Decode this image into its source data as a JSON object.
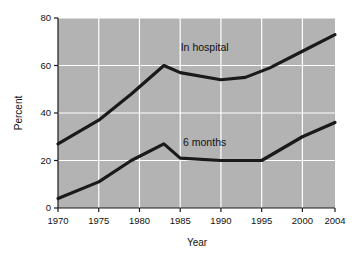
{
  "chart_data": {
    "type": "line",
    "title": "",
    "xlabel": "Year",
    "ylabel": "Percent",
    "xlim": [
      1970,
      2004
    ],
    "ylim": [
      0,
      80
    ],
    "xticks": [
      1970,
      1975,
      1980,
      1985,
      1990,
      1995,
      2000,
      2004
    ],
    "xticklabels": [
      "1970",
      "1975",
      "1980",
      "1985",
      "1990",
      "1995",
      "2000",
      "2004"
    ],
    "yticks": [
      0,
      20,
      40,
      60,
      80
    ],
    "yticklabels": [
      "0",
      "20",
      "40",
      "60",
      "80"
    ],
    "grid": true,
    "grid_color": "#ffffff",
    "plot_background": "#b3b3b3",
    "line_color": "#1a1a1a",
    "legend": "annotations",
    "series": [
      {
        "name": "In hospital",
        "label_x": 1988,
        "label_y": 66,
        "x": [
          1970,
          1975,
          1979,
          1983,
          1985,
          1990,
          1993,
          1996,
          2000,
          2004
        ],
        "values": [
          27,
          37,
          48,
          60,
          57,
          54,
          55,
          59,
          66,
          73
        ]
      },
      {
        "name": "6 months",
        "label_x": 1988,
        "label_y": 26,
        "x": [
          1970,
          1975,
          1979,
          1983,
          1985,
          1990,
          1995,
          2000,
          2004
        ],
        "values": [
          4,
          11,
          20,
          27,
          21,
          20,
          20,
          30,
          36
        ]
      }
    ],
    "annotations": [
      {
        "text": "In hospital",
        "x": 1988,
        "y": 66
      },
      {
        "text": "6 months",
        "x": 1988,
        "y": 26
      }
    ]
  }
}
